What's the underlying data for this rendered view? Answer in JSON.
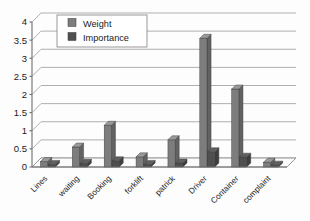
{
  "chart_data": {
    "type": "bar",
    "title": "",
    "subtitle": "",
    "xlabel": "",
    "ylabel": "",
    "categories": [
      "Lines",
      "waiting",
      "Booking",
      "forklift",
      "patrick",
      "Driver",
      "Container",
      "complaint"
    ],
    "series": [
      {
        "name": "Weight",
        "color": "#7d7d7d",
        "values": [
          0.15,
          0.55,
          1.15,
          0.28,
          0.75,
          3.55,
          2.15,
          0.13
        ]
      },
      {
        "name": "Importance",
        "color": "#4f4f4f",
        "values": [
          0.07,
          0.1,
          0.17,
          0.07,
          0.11,
          0.42,
          0.27,
          0.05
        ]
      }
    ],
    "ylim": [
      0,
      4
    ],
    "yticks": [
      "0",
      "0.5",
      "1",
      "1.5",
      "2",
      "2.5",
      "3",
      "3.5",
      "4"
    ],
    "ytick_values": [
      0,
      0.5,
      1,
      1.5,
      2,
      2.5,
      3,
      3.5,
      4
    ],
    "grid": true,
    "legend_position": "top-left",
    "style": "3d-grayscale",
    "xtick_rotation": -45
  },
  "legend": {
    "entries": [
      {
        "label": "Weight",
        "swatch_color": "#7d7d7d"
      },
      {
        "label": "Importance",
        "swatch_color": "#4f4f4f"
      }
    ]
  },
  "axes": {
    "y_axis_name": "value-axis",
    "x_axis_name": "category-axis"
  }
}
